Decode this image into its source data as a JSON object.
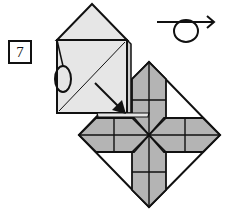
{
  "diagram": {
    "type": "origami-folding-step",
    "step_number": "7",
    "colors": {
      "paper_front": "#e6e6e6",
      "paper_back": "#b4b4b4",
      "line": "#111111",
      "background": "#ffffff"
    },
    "symbols": [
      {
        "name": "turn-over-symbol",
        "meaning": "turn model over"
      },
      {
        "name": "fold-arrow",
        "meaning": "fold flap down toward center"
      },
      {
        "name": "ellipse-marker",
        "meaning": "reference point on flap edge"
      }
    ]
  }
}
